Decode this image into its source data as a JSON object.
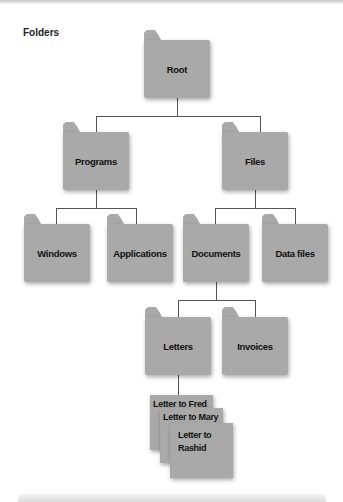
{
  "diagram": {
    "title": "Folders",
    "folders": {
      "root": "Root",
      "programs": "Programs",
      "files": "Files",
      "windows": "Windows",
      "applications": "Applications",
      "documents": "Documents",
      "data_files": "Data files",
      "letters": "Letters",
      "invoices": "Invoices"
    },
    "documents": {
      "letter_fred": "Letter to Fred",
      "letter_mary": "Letter to Mary",
      "letter_rashid": "Letter to Rashid"
    },
    "hierarchy": [
      {
        "parent": "Root",
        "children": [
          "Programs",
          "Files"
        ]
      },
      {
        "parent": "Programs",
        "children": [
          "Windows",
          "Applications"
        ]
      },
      {
        "parent": "Files",
        "children": [
          "Documents",
          "Data files"
        ]
      },
      {
        "parent": "Documents",
        "children": [
          "Letters",
          "Invoices"
        ]
      },
      {
        "parent": "Letters",
        "children": [
          "Letter to Fred",
          "Letter to Mary",
          "Letter to Rashid"
        ]
      }
    ],
    "colors": {
      "folder": "#a9a9a9",
      "connector": "#555555",
      "text": "#111111"
    }
  }
}
